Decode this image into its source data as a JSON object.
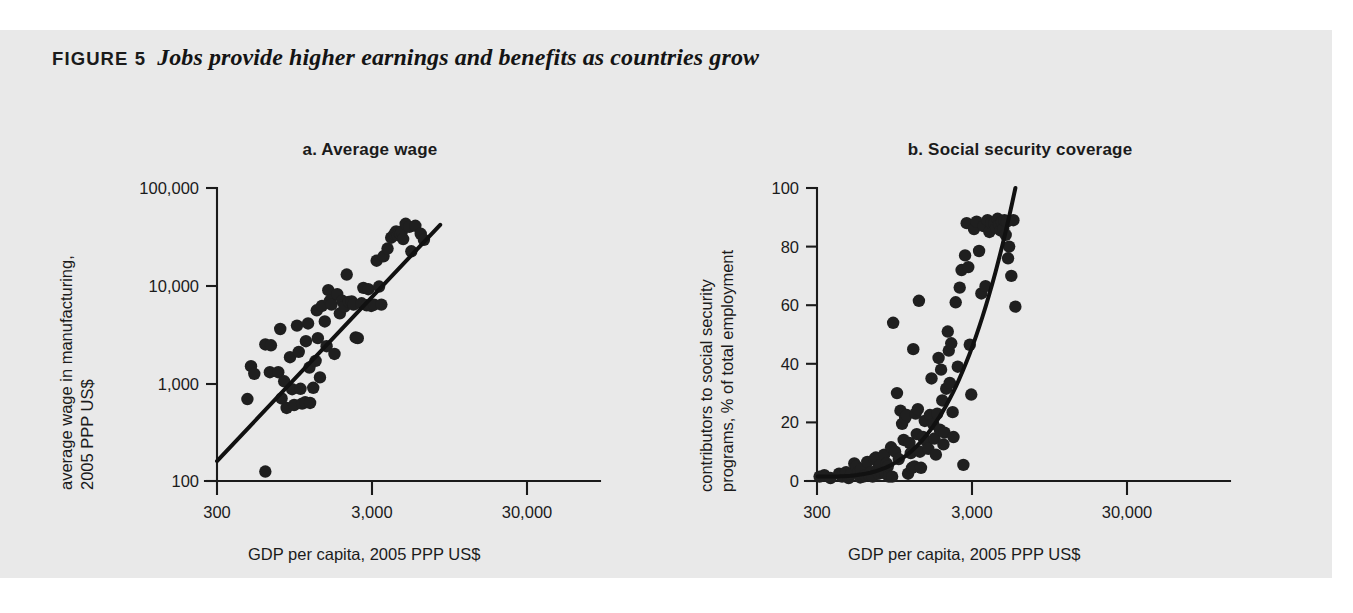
{
  "figure": {
    "label": "FIGURE 5",
    "title": "Jobs provide higher earnings and benefits as countries grow",
    "background_color": "#e9e9e9",
    "ink_color": "#1b1b1b"
  },
  "chart_data": [
    {
      "type": "scatter",
      "panel": "a",
      "title": "a.  Average wage",
      "xlabel": "GDP per capita, 2005 PPP US$",
      "ylabel": "average wage in manufacturing, 2005 PPP US$",
      "ylabel_lines": [
        "average wage in manufacturing,",
        "2005 PPP US$"
      ],
      "xscale": "log",
      "yscale": "log",
      "xticks": [
        300,
        3000,
        30000
      ],
      "xtick_labels": [
        "300",
        "3,000",
        "30,000"
      ],
      "yticks": [
        100,
        1000,
        10000,
        100000
      ],
      "ytick_labels": [
        "100",
        "1,000",
        "10,000",
        "100,000"
      ],
      "xlim": [
        300,
        90000
      ],
      "ylim": [
        100,
        100000
      ],
      "grid": false,
      "legend": "none",
      "trendline": {
        "type": "log-linear",
        "x": [
          300,
          78000
        ],
        "y": [
          160,
          42000
        ]
      },
      "points": [
        [
          640,
          690
        ],
        [
          700,
          1500
        ],
        [
          760,
          1250
        ],
        [
          1000,
          2500
        ],
        [
          1150,
          2450
        ],
        [
          1120,
          1300
        ],
        [
          1380,
          1300
        ],
        [
          1450,
          3600
        ],
        [
          1500,
          700
        ],
        [
          1600,
          1050
        ],
        [
          1700,
          560
        ],
        [
          1850,
          1850
        ],
        [
          1950,
          870
        ],
        [
          2050,
          600
        ],
        [
          2200,
          3900
        ],
        [
          2300,
          2100
        ],
        [
          2400,
          880
        ],
        [
          2500,
          620
        ],
        [
          2700,
          640
        ],
        [
          2750,
          2700
        ],
        [
          2900,
          4100
        ],
        [
          3000,
          1450
        ],
        [
          3050,
          630
        ],
        [
          3300,
          900
        ],
        [
          3500,
          1700
        ],
        [
          3600,
          5600
        ],
        [
          3700,
          2900
        ],
        [
          3900,
          1150
        ],
        [
          4100,
          6200
        ],
        [
          4400,
          4300
        ],
        [
          4600,
          2400
        ],
        [
          4800,
          9000
        ],
        [
          5000,
          7000
        ],
        [
          5200,
          6400
        ],
        [
          5600,
          2000
        ],
        [
          6000,
          8200
        ],
        [
          6400,
          5200
        ],
        [
          6800,
          7000
        ],
        [
          7200,
          6100
        ],
        [
          7600,
          13000
        ],
        [
          8000,
          6800
        ],
        [
          8600,
          6900
        ],
        [
          9000,
          6400
        ],
        [
          9500,
          2950
        ],
        [
          10000,
          2900
        ],
        [
          11000,
          6600
        ],
        [
          11500,
          9500
        ],
        [
          12500,
          6300
        ],
        [
          13000,
          9200
        ],
        [
          14000,
          6200
        ],
        [
          15000,
          6400
        ],
        [
          16000,
          18000
        ],
        [
          17000,
          9800
        ],
        [
          18000,
          6400
        ],
        [
          19000,
          20000
        ],
        [
          21000,
          24000
        ],
        [
          23000,
          31000
        ],
        [
          25000,
          34000
        ],
        [
          26000,
          36000
        ],
        [
          27000,
          33000
        ],
        [
          28000,
          35000
        ],
        [
          29000,
          34000
        ],
        [
          30000,
          36000
        ],
        [
          31000,
          30000
        ],
        [
          33000,
          43000
        ],
        [
          36000,
          40000
        ],
        [
          38000,
          22500
        ],
        [
          42000,
          41000
        ],
        [
          48000,
          34000
        ],
        [
          52000,
          29500
        ],
        [
          1000,
          125
        ]
      ]
    },
    {
      "type": "scatter",
      "panel": "b",
      "title": "b.  Social security coverage",
      "xlabel": "GDP per capita, 2005 PPP US$",
      "ylabel": "contributors to social security programs, % of total employment",
      "ylabel_lines": [
        "contributors to social security",
        "programs, % of total employment"
      ],
      "xscale": "log",
      "yscale": "linear",
      "xticks": [
        300,
        3000,
        30000
      ],
      "xtick_labels": [
        "300",
        "3,000",
        "30,000"
      ],
      "yticks": [
        0,
        20,
        40,
        60,
        80,
        100
      ],
      "ytick_labels": [
        "0",
        "20",
        "40",
        "60",
        "80",
        "100"
      ],
      "xlim": [
        300,
        90000
      ],
      "ylim": [
        0,
        100
      ],
      "grid": false,
      "legend": "none",
      "trendline": {
        "type": "exponential",
        "description": "rising curve from ~2% at 300 to ~100% near 40,000"
      },
      "points": [
        [
          320,
          1.5
        ],
        [
          360,
          2.0
        ],
        [
          420,
          1.0
        ],
        [
          520,
          2.5
        ],
        [
          560,
          1.5
        ],
        [
          620,
          3.0
        ],
        [
          660,
          1.0
        ],
        [
          700,
          2.5
        ],
        [
          760,
          6.0
        ],
        [
          800,
          5.0
        ],
        [
          840,
          3.0
        ],
        [
          880,
          1.2
        ],
        [
          900,
          4.0
        ],
        [
          950,
          1.5
        ],
        [
          1000,
          2.0
        ],
        [
          1050,
          6.5
        ],
        [
          1100,
          2.0
        ],
        [
          1150,
          3.0
        ],
        [
          1200,
          1.5
        ],
        [
          1250,
          7.5
        ],
        [
          1300,
          8.0
        ],
        [
          1350,
          4.0
        ],
        [
          1400,
          2.5
        ],
        [
          1450,
          5.5
        ],
        [
          1500,
          3.0
        ],
        [
          1600,
          9.0
        ],
        [
          1650,
          2.5
        ],
        [
          1700,
          6.0
        ],
        [
          1750,
          5.0
        ],
        [
          1800,
          1.5
        ],
        [
          1900,
          11.5
        ],
        [
          1950,
          1.5
        ],
        [
          2000,
          54.0
        ],
        [
          2100,
          10.0
        ],
        [
          2200,
          30.0
        ],
        [
          2300,
          7.5
        ],
        [
          2400,
          24.0
        ],
        [
          2500,
          19.5
        ],
        [
          2600,
          14.0
        ],
        [
          2700,
          21.5
        ],
        [
          2800,
          22.5
        ],
        [
          2900,
          2.5
        ],
        [
          3000,
          13.0
        ],
        [
          3100,
          9.5
        ],
        [
          3200,
          4.5
        ],
        [
          3300,
          45.0
        ],
        [
          3400,
          5.0
        ],
        [
          3500,
          23.0
        ],
        [
          3600,
          16.0
        ],
        [
          3700,
          24.5
        ],
        [
          3800,
          61.5
        ],
        [
          3900,
          10.0
        ],
        [
          4000,
          4.5
        ],
        [
          4200,
          15.0
        ],
        [
          4400,
          20.5
        ],
        [
          4600,
          13.5
        ],
        [
          4800,
          11.0
        ],
        [
          5000,
          22.5
        ],
        [
          5200,
          35.0
        ],
        [
          5400,
          19.5
        ],
        [
          5600,
          14.5
        ],
        [
          5800,
          9.0
        ],
        [
          6000,
          23.0
        ],
        [
          6200,
          42.0
        ],
        [
          6400,
          17.5
        ],
        [
          6600,
          38.0
        ],
        [
          6800,
          27.5
        ],
        [
          7000,
          12.5
        ],
        [
          7200,
          16.5
        ],
        [
          7500,
          31.5
        ],
        [
          7800,
          51.0
        ],
        [
          8000,
          44.5
        ],
        [
          8200,
          33.5
        ],
        [
          8500,
          47.0
        ],
        [
          8800,
          23.5
        ],
        [
          9000,
          15.0
        ],
        [
          9500,
          61.0
        ],
        [
          10000,
          39.0
        ],
        [
          10500,
          66.0
        ],
        [
          11000,
          72.0
        ],
        [
          11500,
          5.5
        ],
        [
          12000,
          77.0
        ],
        [
          12500,
          88.0
        ],
        [
          13000,
          73.0
        ],
        [
          13500,
          46.5
        ],
        [
          14000,
          29.5
        ],
        [
          15000,
          86.0
        ],
        [
          16000,
          88.5
        ],
        [
          17000,
          78.5
        ],
        [
          18000,
          64.0
        ],
        [
          19000,
          87.0
        ],
        [
          20000,
          66.5
        ],
        [
          21000,
          89.0
        ],
        [
          22000,
          85.0
        ],
        [
          23000,
          88.0
        ],
        [
          25000,
          88.0
        ],
        [
          26000,
          86.5
        ],
        [
          27000,
          89.5
        ],
        [
          28000,
          87.5
        ],
        [
          29000,
          85.5
        ],
        [
          30000,
          88.5
        ],
        [
          31000,
          86.0
        ],
        [
          32000,
          89.0
        ],
        [
          33000,
          84.0
        ],
        [
          34000,
          88.5
        ],
        [
          35000,
          76.0
        ],
        [
          36000,
          80.0
        ],
        [
          38000,
          70.0
        ],
        [
          40000,
          89.0
        ],
        [
          42000,
          59.5
        ]
      ]
    }
  ]
}
